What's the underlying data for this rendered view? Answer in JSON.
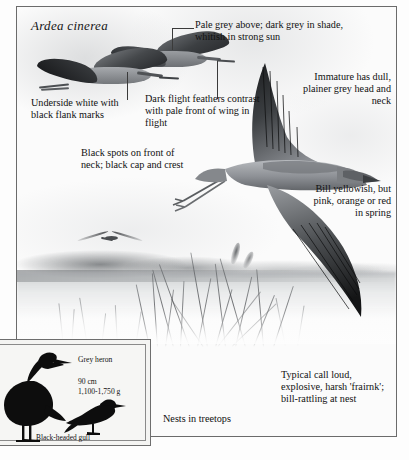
{
  "plate": {
    "scientific_name": "Ardea cinerea"
  },
  "annotations": [
    {
      "id": "pale-grey-above",
      "text": "Pale grey above; dark grey in shade, whitish in strong sun"
    },
    {
      "id": "underside-white",
      "text": "Underside white with black flank marks"
    },
    {
      "id": "dark-flight-feathers",
      "text": "Dark flight feathers contrast with pale front of wing in flight"
    },
    {
      "id": "immature",
      "text": "Immature has dull, plainer grey head and neck"
    },
    {
      "id": "black-spots",
      "text": "Black spots on front of neck; black cap and crest"
    },
    {
      "id": "bill",
      "text": "Bill yellowish, but pink, orange or red in spring"
    },
    {
      "id": "call",
      "text": "Typical call loud, explosive, harsh 'frairnk'; bill-rattling at nest"
    },
    {
      "id": "nests",
      "text": "Nests in treetops"
    }
  ],
  "inset": {
    "heron_label": "Grey heron",
    "heron_length": "90 cm",
    "heron_weight": "1,100-1,750 g",
    "gull_label": "Black-headed gull"
  },
  "colors": {
    "ink": "#111111",
    "frame": "#6b6b6b",
    "silhouette": "#0d0d0d",
    "wing_dark": "#2b2d30",
    "body_grey": "#8d9095",
    "paper": "#fbfbfb"
  }
}
